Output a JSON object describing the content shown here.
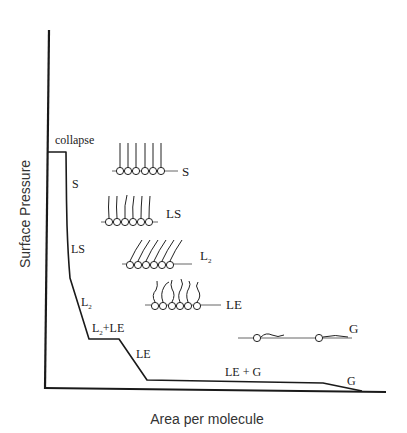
{
  "figure": {
    "type": "surface pressure-area isotherm schematic",
    "y_axis_label": "Surface Pressure",
    "x_axis_label": "Area per molecule"
  },
  "curve_labels": {
    "collapse": "collapse",
    "s": "S",
    "ls": "LS",
    "l2_base": "L",
    "l2_sub": "2",
    "l2_le_base": "L",
    "l2_le_sub": "2",
    "l2_le_rest": "+LE",
    "le": "LE",
    "le_g": "LE + G",
    "g": "G"
  },
  "phase_illustrations": [
    {
      "phase": "S",
      "label": "S",
      "molecule_count": 6,
      "tail_style": "vertical"
    },
    {
      "phase": "LS",
      "label": "LS",
      "molecule_count": 6,
      "tail_style": "nearly vertical, slightly wavy"
    },
    {
      "phase": "L2",
      "label_base": "L",
      "label_sub": "2",
      "molecule_count": 6,
      "tail_style": "tilted"
    },
    {
      "phase": "LE",
      "label": "LE",
      "molecule_count": 6,
      "tail_style": "disordered"
    },
    {
      "phase": "G",
      "label": "G",
      "molecule_count": 2,
      "tail_style": "lying flat"
    }
  ]
}
